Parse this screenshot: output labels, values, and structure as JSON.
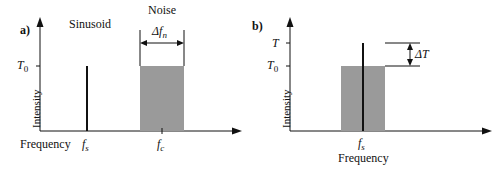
{
  "panel_a": {
    "label": "a)",
    "sinusoid_label": "Sinusoid",
    "noise_label": "Noise",
    "bandwidth_label": "Δf",
    "bandwidth_sub": "n",
    "y_tick": "T",
    "y_tick_sub": "0",
    "y_axis_label": "Intensity",
    "x_axis_label": "Frequency",
    "x_tick_1": "f",
    "x_tick_1_sub": "s",
    "x_tick_2": "f",
    "x_tick_2_sub": "c"
  },
  "panel_b": {
    "label": "b)",
    "y_tick_top": "T",
    "y_tick_base": "T",
    "y_tick_base_sub": "0",
    "delta_label": "ΔT",
    "y_axis_label": "Intensity",
    "x_tick": "f",
    "x_tick_sub": "s",
    "x_axis_label": "Frequency"
  },
  "colors": {
    "noise_fill": "#9a9a9a",
    "line": "#111111"
  }
}
